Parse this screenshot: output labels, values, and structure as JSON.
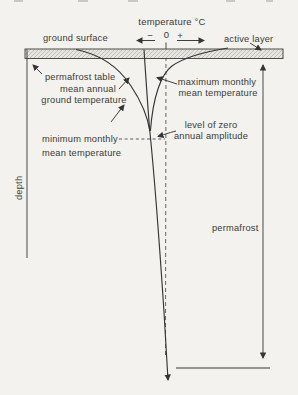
{
  "figure": {
    "type": "permafrost-temperature-depth-diagram",
    "axis": {
      "title": "temperature °C",
      "minus": "−",
      "zero": "0",
      "plus": "+",
      "depth_label": "depth"
    },
    "labels": {
      "ground_surface": "ground surface",
      "active_layer": "active layer",
      "permafrost_table": "permafrost table",
      "mean_annual_line1": "mean annual",
      "mean_annual_line2": "ground temperature",
      "max_monthly_line1": "maximum monthly",
      "max_monthly_line2": "mean temperature",
      "level_zero_line1": "level of zero",
      "level_zero_line2": "annual amplitude",
      "min_monthly_line1": "minimum monthly",
      "min_monthly_line2": "mean temperature",
      "permafrost": "permafrost"
    },
    "colors": {
      "paper": "#f3f2ee",
      "ink": "#353535",
      "band_fill": "#e7e5e0",
      "band_hatch": "#a6a49e"
    }
  }
}
